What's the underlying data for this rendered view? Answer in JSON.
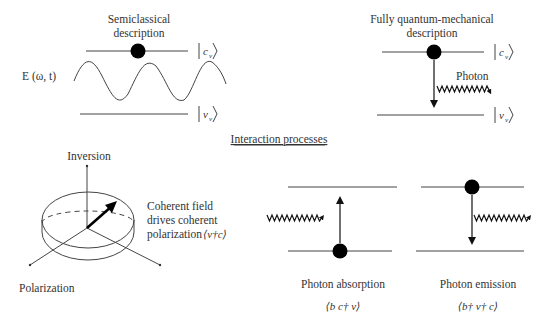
{
  "semiclassical": {
    "title_line1": "Semiclassical",
    "title_line2": "description",
    "field_label": "E (ω, t)",
    "upper_state": "c",
    "lower_state": "v",
    "subscript": "v"
  },
  "quantum": {
    "title_line1": "Fully quantum-mechanical",
    "title_line2": "description",
    "photon_label": "Photon",
    "upper_state": "c",
    "lower_state": "v",
    "subscript": "v"
  },
  "section_title": "Interaction processes",
  "bloch": {
    "axis_top_label": "Inversion",
    "axis_left_label": "Polarization",
    "desc_line1": "Coherent field",
    "desc_line2": "drives coherent",
    "desc_line3": "polarization",
    "desc_math": "⟨v†c⟩"
  },
  "absorption": {
    "label": "Photon absorption",
    "math": "⟨b c† v⟩"
  },
  "emission": {
    "label": "Photon emission",
    "math": "⟨b† v† c⟩"
  }
}
